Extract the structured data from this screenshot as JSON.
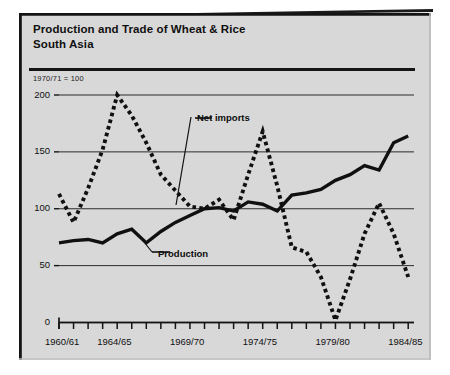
{
  "panel": {
    "background_color": "#d8d8d8",
    "frame_color": "#151515"
  },
  "header": {
    "title_line1": "Production and Trade of Wheat & Rice",
    "title_line2": "South Asia"
  },
  "notes": {
    "index_base": "1970/71  =  100"
  },
  "labels": {
    "net_imports": "Net imports",
    "production": "Production"
  },
  "chart_data": {
    "type": "line",
    "title": "Production and Trade of Wheat & Rice South Asia",
    "subtitle": "1970/71 = 100",
    "xlabel": "",
    "ylabel": "",
    "ylim": [
      0,
      200
    ],
    "yticks": [
      0,
      50,
      100,
      150,
      200
    ],
    "ytick_labels": [
      "0",
      "50",
      "100",
      "150",
      "200"
    ],
    "grid": true,
    "grid_axis": "y",
    "legend_position": "inline-annotation",
    "x": [
      "1960/61",
      "1961/62",
      "1962/63",
      "1963/64",
      "1964/65",
      "1965/66",
      "1966/67",
      "1967/68",
      "1968/69",
      "1969/70",
      "1970/71",
      "1971/72",
      "1972/73",
      "1973/74",
      "1974/75",
      "1975/76",
      "1976/77",
      "1977/78",
      "1978/79",
      "1979/80",
      "1980/81",
      "1981/82",
      "1982/83",
      "1983/84",
      "1984/85"
    ],
    "xtick_labels": [
      "1960/61",
      "1964/65",
      "1969/70",
      "1974/75",
      "1979/80",
      "1984/85"
    ],
    "xtick_label_indices": [
      0,
      4,
      9,
      14,
      19,
      24
    ],
    "series": [
      {
        "name": "Production",
        "style": "solid",
        "color": "#101010",
        "values": [
          70,
          72,
          73,
          70,
          78,
          82,
          70,
          80,
          88,
          94,
          100,
          101,
          98,
          106,
          104,
          98,
          112,
          114,
          117,
          125,
          130,
          138,
          134,
          158,
          164
        ]
      },
      {
        "name": "Net imports",
        "style": "dotted",
        "color": "#101010",
        "values": [
          113,
          88,
          118,
          152,
          200,
          182,
          158,
          130,
          116,
          102,
          100,
          108,
          90,
          130,
          168,
          120,
          66,
          62,
          40,
          2,
          38,
          78,
          105,
          78,
          40
        ]
      }
    ]
  }
}
